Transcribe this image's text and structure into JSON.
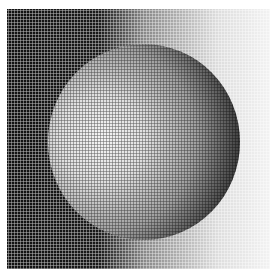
{
  "image": {
    "description": "Halftone dithered rendering of a shaded sphere on a horizontal dark-to-light gradient background",
    "colors": {
      "dark": "#111111",
      "light": "#f2f2f2",
      "page": "#ffffff"
    }
  }
}
